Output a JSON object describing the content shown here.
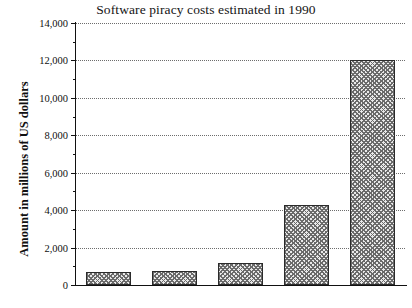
{
  "chart_data": {
    "type": "bar",
    "title": "Software piracy costs estimated in 1990",
    "xlabel": "",
    "ylabel": "Amount in millions of US dollars",
    "categories": [
      "UK and Ireland",
      "France",
      "Germany and Austria",
      "Europe",
      "World"
    ],
    "values": [
      700,
      750,
      1150,
      4300,
      12000
    ],
    "ylim": [
      0,
      14000
    ],
    "ytick_step": 2000,
    "yminor_step": 1000,
    "ytick_labels": [
      "0",
      "2,000",
      "4,000",
      "6,000",
      "8,000",
      "10,000",
      "12,000",
      "14,000"
    ],
    "ytick_values": [
      0,
      2000,
      4000,
      6000,
      8000,
      10000,
      12000,
      14000
    ],
    "grid": true,
    "grid_style": "dotted",
    "legend": null,
    "bar_fill": "cross-hatch",
    "bar_edge_color": "#2b2b2b",
    "bar_fill_color": "#e9e9e9",
    "background_color": "#ffffff",
    "axis_color": "#111111"
  }
}
